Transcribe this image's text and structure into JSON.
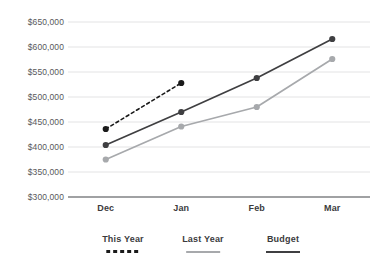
{
  "chart_data": {
    "type": "line",
    "title": "",
    "subtitle": "",
    "xlabel": "",
    "ylabel": "",
    "categories": [
      "Dec",
      "Jan",
      "Feb",
      "Mar"
    ],
    "ylim": [
      300000,
      650000
    ],
    "ytick_step": 50000,
    "ytick_labels": [
      "$650,000",
      "$600,000",
      "$550,000",
      "$500,000",
      "$450,000",
      "$400,000",
      "$350,000",
      "$300,000"
    ],
    "ytick_values": [
      650000,
      600000,
      550000,
      500000,
      450000,
      400000,
      350000,
      300000
    ],
    "grid": true,
    "grid_axis": "y",
    "legend_position": "bottom",
    "markers": true,
    "series": [
      {
        "name": "This Year",
        "style": "dashed",
        "color": "#1a1a1a",
        "values": [
          436000,
          528000,
          null,
          null
        ]
      },
      {
        "name": "Budget",
        "style": "solid",
        "color": "#3f3f41",
        "values": [
          404000,
          470000,
          538000,
          616000
        ]
      },
      {
        "name": "Last Year",
        "style": "solid",
        "color": "#a7a9ac",
        "values": [
          375000,
          441000,
          480000,
          576000
        ]
      }
    ]
  },
  "legend": {
    "items": [
      {
        "label": "This Year",
        "swatch": "dashed-line-swatch"
      },
      {
        "label": "Last Year",
        "swatch": "solid-gray-line-swatch"
      },
      {
        "label": "Budget",
        "swatch": "solid-dark-line-swatch"
      }
    ]
  },
  "axes": {
    "baseline_color": "#808285",
    "gridline_color": "#e3e3e4"
  }
}
